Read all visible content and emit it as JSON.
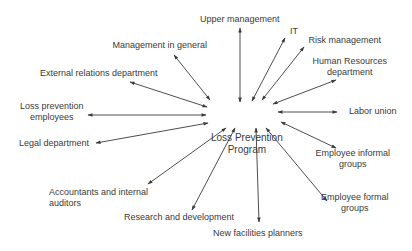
{
  "diagram": {
    "type": "hub-and-spoke",
    "stroke_color": "#3a3a3a",
    "center": {
      "id": "center",
      "lines": [
        "Loss Prevention",
        "Program"
      ]
    },
    "nodes": [
      {
        "id": "upper-management",
        "lines": [
          "Upper management"
        ],
        "arrow": "bidirectional"
      },
      {
        "id": "it",
        "lines": [
          "IT"
        ],
        "arrow": "bidirectional"
      },
      {
        "id": "risk-management",
        "lines": [
          "Risk management"
        ],
        "arrow": "bidirectional"
      },
      {
        "id": "human-resources-department",
        "lines": [
          "Human Resources",
          "department"
        ],
        "arrow": "bidirectional"
      },
      {
        "id": "labor-union",
        "lines": [
          "Labor union"
        ],
        "arrow": "bidirectional"
      },
      {
        "id": "employee-informal-groups",
        "lines": [
          "Employee informal",
          "groups"
        ],
        "arrow": "bidirectional"
      },
      {
        "id": "employee-formal-groups",
        "lines": [
          "Employee formal",
          "groups"
        ],
        "arrow": "bidirectional"
      },
      {
        "id": "new-facilities-planners",
        "lines": [
          "New facilities planners"
        ],
        "arrow": "bidirectional"
      },
      {
        "id": "research-and-development",
        "lines": [
          "Research and development"
        ],
        "arrow": "bidirectional"
      },
      {
        "id": "accountants-and-internal-auditors",
        "lines": [
          "Accountants and internal",
          "auditors"
        ],
        "arrow": "bidirectional"
      },
      {
        "id": "legal-department",
        "lines": [
          "Legal department"
        ],
        "arrow": "bidirectional"
      },
      {
        "id": "loss-prevention-employees",
        "lines": [
          "Loss prevention",
          "employees"
        ],
        "arrow": "bidirectional"
      },
      {
        "id": "external-relations-department",
        "lines": [
          "External relations department"
        ],
        "arrow": "bidirectional"
      },
      {
        "id": "management-in-general",
        "lines": [
          "Management in general"
        ],
        "arrow": "bidirectional"
      }
    ]
  }
}
